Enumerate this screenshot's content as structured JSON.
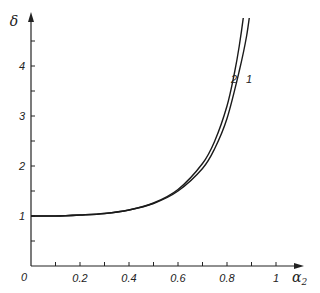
{
  "chart_data": {
    "type": "line",
    "title": "",
    "xlabel": "α₂",
    "ylabel": "δ",
    "xlim": [
      0,
      1.05
    ],
    "ylim": [
      0,
      5
    ],
    "grid": false,
    "legend": "inline curve labels",
    "x_ticks": [
      "0",
      "0.2",
      "0.4",
      "0.6",
      "0.8",
      "1"
    ],
    "y_ticks": [
      "1",
      "2",
      "3",
      "4"
    ],
    "series": [
      {
        "name": "1",
        "x": [
          0,
          0.1,
          0.2,
          0.3,
          0.4,
          0.5,
          0.6,
          0.7,
          0.75,
          0.8,
          0.85,
          0.88,
          0.9,
          0.92
        ],
        "y": [
          1.0,
          1.0,
          1.02,
          1.05,
          1.12,
          1.25,
          1.5,
          1.95,
          2.35,
          2.95,
          3.9,
          4.6,
          5.3,
          6.0
        ]
      },
      {
        "name": "2",
        "x": [
          0,
          0.1,
          0.2,
          0.3,
          0.4,
          0.5,
          0.6,
          0.7,
          0.75,
          0.8,
          0.83,
          0.85,
          0.87,
          0.89
        ],
        "y": [
          1.0,
          1.0,
          1.02,
          1.05,
          1.12,
          1.26,
          1.53,
          2.05,
          2.5,
          3.2,
          3.85,
          4.4,
          5.1,
          6.0
        ]
      }
    ]
  },
  "labels": {
    "y_axis": "δ",
    "x_axis_main": "α",
    "x_axis_sub": "2",
    "origin": "0",
    "curve_1": "1",
    "curve_2": "2"
  }
}
